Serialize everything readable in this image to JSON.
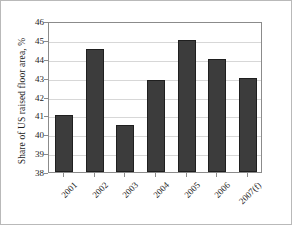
{
  "chart_data": {
    "type": "bar",
    "title": "",
    "xlabel": "",
    "ylabel": "Share of US raised floor area, %",
    "categories": [
      "2001",
      "2002",
      "2003",
      "2004",
      "2005",
      "2006",
      "2007(f)"
    ],
    "values": [
      41.0,
      44.5,
      40.5,
      42.9,
      45.0,
      44.0,
      43.0
    ],
    "ylim": [
      38,
      46
    ],
    "yticks": [
      38,
      39,
      40,
      41,
      42,
      43,
      44,
      45,
      46
    ],
    "ytick_labels": [
      "38",
      "39",
      "40",
      "41",
      "42",
      "43",
      "44",
      "45",
      "46"
    ],
    "grid": true,
    "legend": false,
    "bar_color": "#3c3c3c",
    "bar_edge_color": "#1f1f1f",
    "grid_color": "#d7d7d7",
    "axis_color": "#8b8b8b"
  }
}
